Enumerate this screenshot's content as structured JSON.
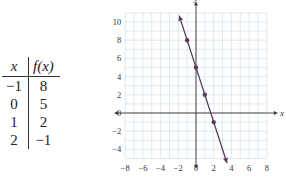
{
  "table": {
    "headers": [
      "x",
      "f(x)"
    ],
    "rows": [
      [
        "−1",
        "8"
      ],
      [
        "0",
        "5"
      ],
      [
        "1",
        "2"
      ],
      [
        "2",
        "−1"
      ]
    ]
  },
  "chart_data": {
    "type": "line",
    "title": "",
    "xlabel": "x",
    "ylabel": "y",
    "xlim": [
      -8,
      8
    ],
    "ylim": [
      -5,
      11
    ],
    "x_ticks": [
      "−8",
      "−6",
      "−4",
      "−2",
      "0",
      "2",
      "4",
      "6",
      "8"
    ],
    "y_ticks": [
      "10",
      "8",
      "6",
      "4",
      "2",
      "0",
      "−2",
      "−4"
    ],
    "grid": true,
    "series": [
      {
        "name": "f(x) = -3x + 5",
        "x": [
          -1,
          0,
          1,
          2
        ],
        "y": [
          8,
          5,
          2,
          -1
        ],
        "color": "#5a3b5e"
      }
    ],
    "line_extent": {
      "x": [
        -1.9,
        3.5
      ],
      "y": [
        10.7,
        -5.5
      ]
    }
  }
}
